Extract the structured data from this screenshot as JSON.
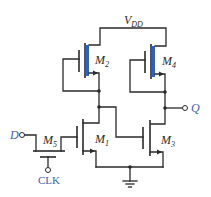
{
  "diagram": {
    "type": "CMOS dynamic D latch schematic",
    "supply_label": {
      "main": "V",
      "sub": "DD"
    },
    "transistors": [
      {
        "id": "M2",
        "main": "M",
        "sub": "2",
        "type": "PMOS"
      },
      {
        "id": "M4",
        "main": "M",
        "sub": "4",
        "type": "PMOS"
      },
      {
        "id": "M1",
        "main": "M",
        "sub": "1",
        "type": "NMOS"
      },
      {
        "id": "M3",
        "main": "M",
        "sub": "3",
        "type": "NMOS"
      },
      {
        "id": "M5",
        "main": "M",
        "sub": "5",
        "type": "pass transistor"
      }
    ],
    "terminals": {
      "input": "D",
      "output": "Q",
      "clock": "CLK"
    },
    "colors": {
      "wire": "#2a2a2a",
      "pmos_channel": "#2f5fc8",
      "terminal_label": "#4060b0"
    }
  }
}
